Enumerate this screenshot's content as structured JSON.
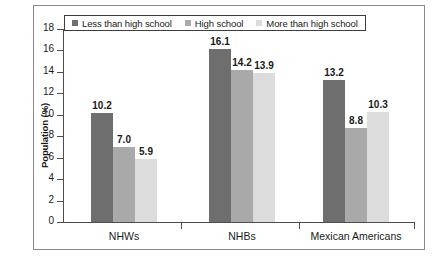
{
  "chart_data": {
    "type": "bar",
    "title": "",
    "subtitle": "",
    "xlabel": "",
    "ylabel": "Population (%)",
    "categories": [
      "NHWs",
      "NHBs",
      "Mexican Americans"
    ],
    "series": [
      {
        "name": "Less than high school",
        "color": "#6e6e6e",
        "values": [
          10.2,
          16.1,
          13.2
        ],
        "labels": [
          "10.2",
          "16.1",
          "13.2"
        ]
      },
      {
        "name": "High school",
        "color": "#a9a9a9",
        "values": [
          7.0,
          14.2,
          8.8
        ],
        "labels": [
          "7.0",
          "14.2",
          "8.8"
        ]
      },
      {
        "name": "More than high school",
        "color": "#dcdcdc",
        "values": [
          5.9,
          13.9,
          10.3
        ],
        "labels": [
          "5.9",
          "13.9",
          "10.3"
        ]
      }
    ],
    "ylim": [
      0,
      18
    ],
    "ytick_step": 2,
    "ytick_labels": [
      "18",
      "16",
      "14",
      "12",
      "10",
      "8",
      "6",
      "4",
      "2",
      "0"
    ],
    "ytick_values": [
      18,
      16,
      14,
      12,
      10,
      8,
      6,
      4,
      2,
      0
    ],
    "grid": false,
    "legend_position": "top-left",
    "bar_labels_shown": true,
    "axis_color": "#4d4d4d",
    "border_color": "#8a8a8a",
    "background": "#ffffff"
  }
}
